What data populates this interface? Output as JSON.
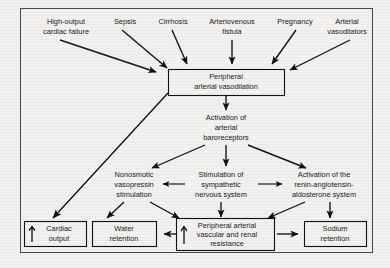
{
  "diagram": {
    "type": "flowchart",
    "frame": {
      "stroke_color": "#4a4a4a"
    },
    "background_color": "#f2f1ef",
    "arrow_color": "#111111",
    "causes": [
      {
        "id": "high-output-cardiac-failure",
        "line1": "High-output",
        "line2": "cardiac failure"
      },
      {
        "id": "sepsis",
        "line1": "Sepsis",
        "line2": ""
      },
      {
        "id": "cirrhosis",
        "line1": "Cirrhosis",
        "line2": ""
      },
      {
        "id": "arteriovenous-fistula",
        "line1": "Arteriovenous",
        "line2": "fistula"
      },
      {
        "id": "pregnancy",
        "line1": "Pregnancy",
        "line2": ""
      },
      {
        "id": "arterial-vasodilators",
        "line1": "Arterial",
        "line2": "vasodilators"
      }
    ],
    "central_node": {
      "id": "peripheral-arterial-vasodilation",
      "line1": "Peripheral",
      "line2": "arterial vasodilation"
    },
    "baroreceptor_node": {
      "id": "activation-of-arterial-baroreceptors",
      "line1": "Activation of",
      "line2": "arterial",
      "line3": "baroreceptors"
    },
    "effector_nodes": [
      {
        "id": "nonosmotic-vasopressin-stimulation",
        "line1": "Nonosmotic",
        "line2": "vasopressin",
        "line3": "stimulation"
      },
      {
        "id": "stimulation-of-sympathetic-nervous-system",
        "line1": "Stimulation of",
        "line2": "sympathetic",
        "line3": "nervous system"
      },
      {
        "id": "activation-of-renin-angiotensin-aldosterone-system",
        "line1": "Activation of the",
        "line2": "renin-angiotensin-",
        "line3": "aldosterone system"
      }
    ],
    "outcome_nodes": [
      {
        "id": "cardiac-output",
        "line1": "Cardiac",
        "line2": "output",
        "line3": "",
        "marker": "up-arrow"
      },
      {
        "id": "water-retention",
        "line1": "Water",
        "line2": "retention",
        "line3": "",
        "marker": "none"
      },
      {
        "id": "peripheral-arterial-vascular-and-renal-resistance",
        "line1": "Peripheral arterial",
        "line2": "vascular and renal",
        "line3": "resistance",
        "marker": "up-arrow"
      },
      {
        "id": "sodium-retention",
        "line1": "Sodium",
        "line2": "retention",
        "line3": "",
        "marker": "none"
      }
    ]
  }
}
